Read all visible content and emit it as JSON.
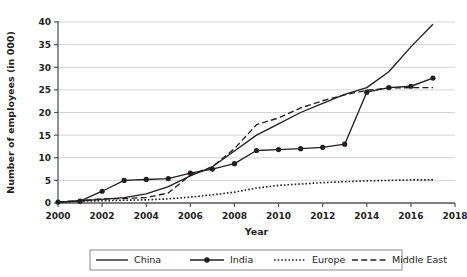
{
  "chart_data": {
    "type": "line",
    "title": "",
    "xlabel": "Year",
    "ylabel": "Number of employees (in 000)",
    "xlim": [
      2000,
      2018
    ],
    "ylim": [
      0,
      40
    ],
    "xticks": [
      2000,
      2002,
      2004,
      2006,
      2008,
      2010,
      2012,
      2014,
      2016,
      2018
    ],
    "yticks": [
      0,
      5,
      10,
      15,
      20,
      25,
      30,
      35,
      40
    ],
    "grid": "horizontal",
    "legend_position": "bottom",
    "x": [
      2000,
      2001,
      2002,
      2003,
      2004,
      2005,
      2006,
      2007,
      2008,
      2009,
      2010,
      2011,
      2012,
      2013,
      2014,
      2015,
      2016,
      2017
    ],
    "series": [
      {
        "name": "China",
        "style": "solid",
        "marker": "none",
        "color": "#231f20",
        "values": [
          0.2,
          0.5,
          0.8,
          1.2,
          2.0,
          3.6,
          6.0,
          8.0,
          11.5,
          15.0,
          17.5,
          20.0,
          22.0,
          24.0,
          25.5,
          29.0,
          34.5,
          39.5
        ]
      },
      {
        "name": "India",
        "style": "solid",
        "marker": "circle",
        "color": "#231f20",
        "values": [
          0.2,
          0.4,
          2.6,
          5.0,
          5.2,
          5.4,
          6.6,
          7.5,
          8.7,
          11.6,
          11.8,
          12.0,
          12.3,
          13.0,
          24.5,
          25.5,
          25.8,
          27.6
        ]
      },
      {
        "name": "Europe",
        "style": "dotted",
        "marker": "none",
        "color": "#231f20",
        "values": [
          0.2,
          0.4,
          0.5,
          0.6,
          0.7,
          0.9,
          1.3,
          1.8,
          2.4,
          3.3,
          3.9,
          4.2,
          4.5,
          4.7,
          4.9,
          5.0,
          5.1,
          5.1
        ]
      },
      {
        "name": "Middle East",
        "style": "dashed",
        "marker": "none",
        "color": "#231f20",
        "values": [
          0.2,
          0.5,
          0.9,
          1.0,
          1.2,
          2.2,
          6.2,
          8.0,
          12.0,
          17.3,
          18.8,
          21.0,
          22.6,
          23.9,
          24.9,
          25.4,
          25.5,
          25.5
        ]
      }
    ]
  },
  "legend": {
    "items": [
      {
        "label": "China"
      },
      {
        "label": "India"
      },
      {
        "label": "Europe"
      },
      {
        "label": "Middle East"
      }
    ]
  },
  "axes": {
    "y_title": "Number of employees (in 000)",
    "x_title": "Year"
  }
}
